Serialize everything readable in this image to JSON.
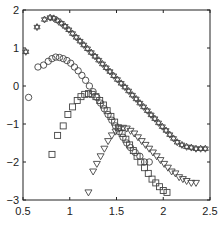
{
  "chart_data": {
    "type": "scatter",
    "title": "",
    "xlabel": "",
    "ylabel": "",
    "xlim": [
      0.5,
      2.5
    ],
    "ylim": [
      -3,
      2
    ],
    "xticks": [
      0.5,
      1,
      1.5,
      2,
      2.5
    ],
    "xtick_labels": [
      "0.5",
      "1",
      "1.5",
      "2",
      "2.5"
    ],
    "yticks": [
      -3,
      -2,
      -1,
      0,
      1,
      2
    ],
    "ytick_labels": [
      "-3",
      "-2",
      "-1",
      "0",
      "1",
      "2"
    ],
    "grid": false,
    "legend": null,
    "series": [
      {
        "name": "hexagram",
        "marker": "hexagram",
        "x": [
          0.53,
          0.65,
          0.73,
          0.79,
          0.83,
          0.87,
          0.91,
          0.95,
          0.99,
          1.03,
          1.07,
          1.11,
          1.15,
          1.19,
          1.23,
          1.27,
          1.31,
          1.35,
          1.39,
          1.43,
          1.47,
          1.51,
          1.55,
          1.59,
          1.63,
          1.67,
          1.71,
          1.75,
          1.79,
          1.83,
          1.87,
          1.91,
          1.95,
          1.99,
          2.03,
          2.07,
          2.11,
          2.15,
          2.2,
          2.25,
          2.3,
          2.35,
          2.4,
          2.45
        ],
        "y": [
          0.9,
          1.55,
          1.75,
          1.8,
          1.78,
          1.72,
          1.65,
          1.57,
          1.48,
          1.38,
          1.28,
          1.18,
          1.08,
          0.98,
          0.88,
          0.78,
          0.68,
          0.58,
          0.48,
          0.38,
          0.27,
          0.17,
          0.07,
          -0.03,
          -0.13,
          -0.24,
          -0.34,
          -0.45,
          -0.55,
          -0.65,
          -0.76,
          -0.86,
          -0.97,
          -1.07,
          -1.17,
          -1.28,
          -1.38,
          -1.48,
          -1.55,
          -1.6,
          -1.62,
          -1.65,
          -1.65,
          -1.65
        ]
      },
      {
        "name": "circle",
        "marker": "circle",
        "x": [
          0.56,
          0.66,
          0.72,
          0.77,
          0.81,
          0.85,
          0.89,
          0.93,
          0.97,
          1.01,
          1.05,
          1.09,
          1.13,
          1.17,
          1.21,
          1.25,
          1.29,
          1.33,
          1.37,
          1.41,
          1.45,
          1.49,
          1.53,
          1.57,
          1.61,
          1.65,
          1.7,
          1.75,
          1.8,
          1.85
        ],
        "y": [
          -0.3,
          0.5,
          0.55,
          0.65,
          0.72,
          0.76,
          0.75,
          0.72,
          0.67,
          0.6,
          0.5,
          0.4,
          0.28,
          0.15,
          0.0,
          -0.15,
          -0.3,
          -0.45,
          -0.6,
          -0.75,
          -0.9,
          -1.05,
          -1.2,
          -1.35,
          -1.5,
          -1.62,
          -1.75,
          -1.85,
          -2.0,
          -2.0
        ]
      },
      {
        "name": "square",
        "marker": "square",
        "x": [
          0.81,
          0.87,
          0.93,
          0.98,
          1.03,
          1.08,
          1.12,
          1.16,
          1.2,
          1.24,
          1.28,
          1.32,
          1.36,
          1.4,
          1.44,
          1.48,
          1.52,
          1.56,
          1.6,
          1.64,
          1.68,
          1.72,
          1.76,
          1.8,
          1.84,
          1.88,
          1.92,
          1.96,
          2.0,
          2.04
        ],
        "y": [
          -1.8,
          -1.3,
          -1.05,
          -0.75,
          -0.55,
          -0.38,
          -0.28,
          -0.22,
          -0.2,
          -0.22,
          -0.28,
          -0.38,
          -0.5,
          -0.65,
          -0.8,
          -0.95,
          -1.1,
          -1.25,
          -1.4,
          -1.55,
          -1.7,
          -1.85,
          -2.0,
          -2.15,
          -2.3,
          -2.45,
          -2.55,
          -2.65,
          -2.75,
          -2.8
        ]
      },
      {
        "name": "triangle-down",
        "marker": "triangle-down",
        "x": [
          1.2,
          1.25,
          1.29,
          1.33,
          1.37,
          1.41,
          1.45,
          1.49,
          1.53,
          1.57,
          1.61,
          1.65,
          1.69,
          1.73,
          1.77,
          1.81,
          1.85,
          1.89,
          1.93,
          1.97,
          2.01,
          2.05,
          2.09,
          2.13,
          2.17,
          2.21,
          2.25,
          2.3,
          2.35
        ],
        "y": [
          -2.8,
          -2.25,
          -2.05,
          -1.85,
          -1.65,
          -1.45,
          -1.3,
          -1.2,
          -1.12,
          -1.1,
          -1.12,
          -1.18,
          -1.25,
          -1.35,
          -1.45,
          -1.55,
          -1.65,
          -1.75,
          -1.85,
          -1.95,
          -2.05,
          -2.15,
          -2.25,
          -2.3,
          -2.4,
          -2.45,
          -2.5,
          -2.55,
          -2.55
        ]
      }
    ]
  }
}
